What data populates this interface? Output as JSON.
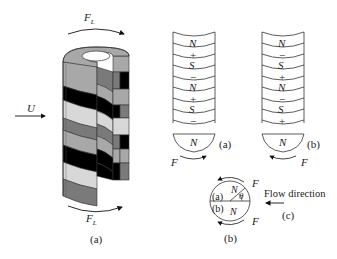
{
  "figure_a": {
    "caption": "(a)",
    "flow_label": "U",
    "force_top": "F",
    "force_top_sub": "L",
    "force_bottom": "F",
    "force_bottom_sub": "L",
    "band_colors": [
      "#a8a8a8",
      "#000000",
      "#d8d8d8",
      "#7a7a7a",
      "#a8a8a8",
      "#000000",
      "#d8d8d8",
      "#7a7a7a"
    ]
  },
  "figure_b": {
    "caption": "(b)",
    "stack_a": {
      "labels": [
        "N",
        "+",
        "S",
        "−",
        "N",
        "+",
        "S",
        "−"
      ],
      "bottom_pole": "N",
      "force": "F",
      "caption": "(a)"
    },
    "stack_b": {
      "labels": [
        "N",
        "−",
        "S",
        "+",
        "N",
        "−",
        "S",
        "+"
      ],
      "bottom_pole": "N",
      "force": "F",
      "caption": "(b)"
    },
    "circle": {
      "upper_tag": "(a)",
      "upper_pole": "N",
      "lower_tag": "(b)",
      "lower_pole": "N",
      "angle": "θ",
      "force_top": "F",
      "force_bottom": "F"
    },
    "flow_direction_label": "Flow direction",
    "flow_caption": "(c)"
  }
}
